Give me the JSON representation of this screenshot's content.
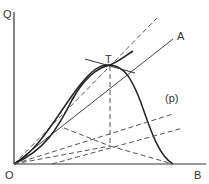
{
  "diagram": {
    "labels": {
      "y_axis": "Q",
      "x_axis": "B",
      "origin": "O",
      "tangent_point": "T",
      "ray": "A",
      "curve_p": "(p)"
    },
    "colors": {
      "line": "#333333",
      "background": "#ffffff"
    }
  }
}
